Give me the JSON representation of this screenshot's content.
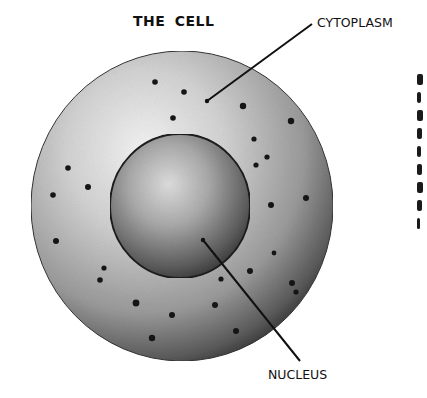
{
  "diagram": {
    "title": "THE CELL",
    "labels": {
      "cytoplasm": "CYTOPLASM",
      "nucleus": "NUCLEUS"
    },
    "cell": {
      "cx": 182,
      "cy": 206,
      "rx": 151,
      "ry": 155
    },
    "nucleus": {
      "cx": 180,
      "cy": 206,
      "rx": 70,
      "ry": 72
    },
    "leader_lines": {
      "cytoplasm": {
        "x1": 312,
        "y1": 24,
        "x2": 207,
        "y2": 101
      },
      "nucleus": {
        "x1": 203,
        "y1": 240,
        "x2": 300,
        "y2": 361
      }
    },
    "colors": {
      "ink": "#111111",
      "cell_light": "#f2f2f2",
      "cell_mid": "#a8a8a8",
      "cell_dark": "#2a2a2a",
      "nucleus_light": "#d9d9d9",
      "nucleus_dark": "#3a3a3a"
    },
    "right_margin_fragments": "clipped text column (unreadable)"
  }
}
